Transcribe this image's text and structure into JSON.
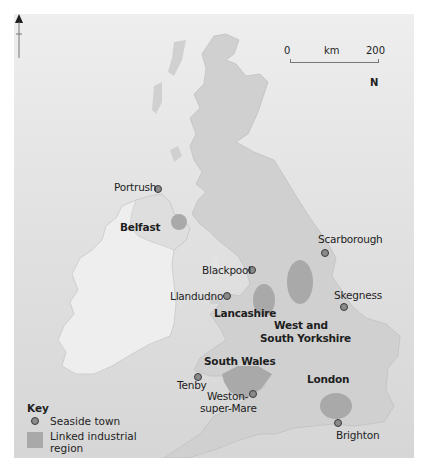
{
  "map": {
    "title": "",
    "scale": {
      "start": "0",
      "unit": "km",
      "end": "200"
    },
    "north_label": "N",
    "colors": {
      "sea": "#e0e0e0",
      "land": "#cfcfcf",
      "ireland_land": "#ececec",
      "northern_ireland_land": "#dedede",
      "industrial_region": "#a9a9a9",
      "seaside_dot_fill": "#8a8a8a",
      "seaside_dot_stroke": "#3a3a3a"
    },
    "seaside_towns": [
      {
        "name": "Portrush",
        "x": 157,
        "y": 189
      },
      {
        "name": "Blackpool",
        "x": 250,
        "y": 270
      },
      {
        "name": "Llandudno",
        "x": 226,
        "y": 296
      },
      {
        "name": "Scarborough",
        "x": 324,
        "y": 249
      },
      {
        "name": "Skegness",
        "x": 343,
        "y": 302
      },
      {
        "name": "Tenby",
        "x": 196,
        "y": 375
      },
      {
        "name": "Weston-super-Mare",
        "x": 252,
        "y": 393
      },
      {
        "name": "Brighton",
        "x": 337,
        "y": 423
      }
    ],
    "industrial_regions": [
      {
        "name": "Belfast"
      },
      {
        "name": "Lancashire"
      },
      {
        "name": "West and South Yorkshire"
      },
      {
        "name": "South Wales"
      },
      {
        "name": "London"
      }
    ],
    "labels": {
      "portrush": "Portrush",
      "belfast": "Belfast",
      "blackpool": "Blackpool",
      "llandudno": "Llandudno",
      "lancashire": "Lancashire",
      "scarborough": "Scarborough",
      "skegness": "Skegness",
      "west_yorkshire_1": "West and",
      "west_yorkshire_2": "South Yorkshire",
      "south_wales": "South Wales",
      "london": "London",
      "tenby": "Tenby",
      "weston_1": "Weston-",
      "weston_2": "super-Mare",
      "brighton": "Brighton"
    }
  },
  "key": {
    "title": "Key",
    "items": [
      {
        "symbol": "dot",
        "label": "Seaside town"
      },
      {
        "symbol": "swatch",
        "label": "Linked industrial region"
      }
    ]
  }
}
